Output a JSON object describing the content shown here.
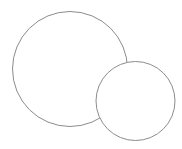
{
  "canvas": {
    "width": 182,
    "height": 149,
    "background": "#ffffff"
  },
  "shapes": [
    {
      "id": "large-circle",
      "type": "circle",
      "cx": 70,
      "cy": 69,
      "r": 57.5,
      "fill": "#ffffff",
      "stroke": "#8c8c8c",
      "stroke_width": 1,
      "z_order": 1
    },
    {
      "id": "small-circle",
      "type": "circle",
      "cx": 135.5,
      "cy": 101,
      "r": 39.5,
      "fill": "#ffffff",
      "stroke": "#8c8c8c",
      "stroke_width": 1,
      "z_order": 2
    }
  ]
}
